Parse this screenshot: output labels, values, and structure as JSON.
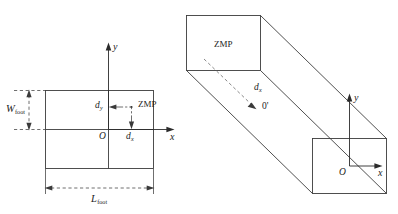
{
  "figure": {
    "background_color": "#ffffff",
    "line_color": "#3c3c3c",
    "text_color": "#1b1b1b",
    "width": 398,
    "height": 214
  },
  "left_view": {
    "name": "top-view-of-foot",
    "axes": {
      "x_label": "x",
      "y_label": "y",
      "origin_label": "O"
    },
    "zmp": {
      "label": "ZMP",
      "offset_x_label": "d",
      "offset_x_sub": "x",
      "offset_y_label": "d",
      "offset_y_sub": "y"
    },
    "dimensions": [
      {
        "label": "W",
        "sub": "foot",
        "orientation": "vertical"
      },
      {
        "label": "L",
        "sub": "foot",
        "orientation": "horizontal"
      }
    ]
  },
  "right_view": {
    "name": "three-dimensional-foot-prism",
    "axes": {
      "x_label": "x",
      "y_label": "y",
      "origin_label": "O"
    },
    "zmp": {
      "label": "ZMP",
      "offset_label": "d",
      "offset_sub": "x",
      "projected_origin_label": "0'"
    }
  }
}
